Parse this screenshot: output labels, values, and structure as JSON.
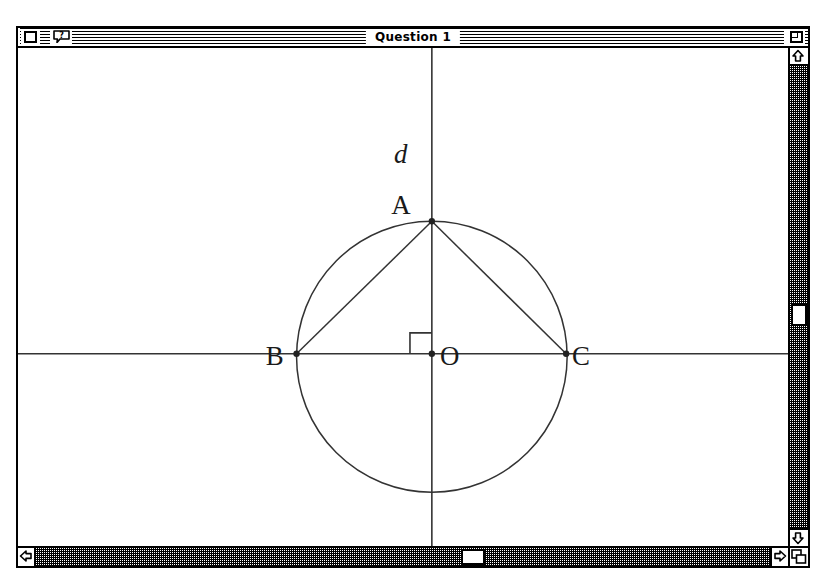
{
  "window": {
    "title": "Question 1",
    "close_box": "close-box",
    "help_button": "help-balloon",
    "zoom_box": "zoom-box",
    "grow_box": "grow-box"
  },
  "scrollbars": {
    "vertical": {
      "up_arrow": "scroll-up",
      "down_arrow": "scroll-down",
      "thumb_top_px": 238
    },
    "horizontal": {
      "left_arrow": "scroll-left",
      "right_arrow": "scroll-right",
      "thumb_left_px": 425
    }
  },
  "figure": {
    "type": "geometry-diagram",
    "axes": {
      "horizontal_y": 307,
      "vertical_x": 416
    },
    "circle": {
      "cx": 416,
      "cy": 310,
      "r": 136
    },
    "points": [
      {
        "name": "A",
        "x": 416,
        "y": 174,
        "label_x": 385,
        "label_y": 167,
        "dot": true
      },
      {
        "name": "B",
        "x": 280,
        "y": 307,
        "label_x": 250,
        "label_y": 317,
        "dot": true
      },
      {
        "name": "C",
        "x": 551,
        "y": 307,
        "label_x": 556,
        "label_y": 317,
        "dot": true
      },
      {
        "name": "O",
        "x": 416,
        "y": 307,
        "label_x": 422,
        "label_y": 317,
        "dot": true
      }
    ],
    "segments": [
      {
        "name": "AB",
        "from": "A",
        "to": "B"
      },
      {
        "name": "AC",
        "from": "A",
        "to": "C"
      },
      {
        "name": "BC",
        "from": "B",
        "to": "C"
      },
      {
        "name": "AO",
        "from": "A",
        "to": "O"
      }
    ],
    "right_angle_mark": {
      "x": 416,
      "y": 307,
      "size": 22
    },
    "annotations": [
      {
        "name": "d",
        "text": "d",
        "x": 378,
        "y": 115,
        "style": "italic"
      }
    ],
    "labels": {
      "A": "A",
      "B": "B",
      "C": "C",
      "O": "O",
      "d": "d"
    }
  }
}
